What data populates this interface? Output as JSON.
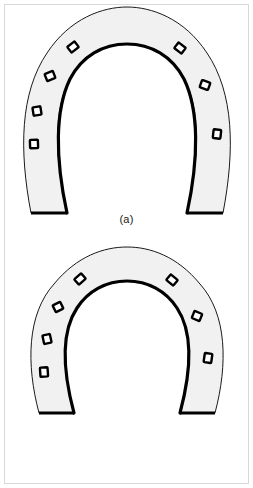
{
  "page": {
    "background_color": "#ffffff",
    "border_color": "#d8d8d8",
    "width": 253,
    "height": 488
  },
  "figures": [
    {
      "id": "figure-a",
      "caption": "(a)",
      "object": "horseshoe",
      "description": "horseshoe outline, plan view, fullered shoe with nail holes",
      "fill_color": "#f1f1f1",
      "outer_stroke_color": "#1a1a1a",
      "inner_stroke_color": "#000000",
      "outer_stroke_width": 1,
      "inner_stroke_width": 3,
      "nail_holes": {
        "total": 7,
        "left_branch": 4,
        "right_branch": 3,
        "hole_fill": "#ffffff",
        "hole_stroke": "#000000"
      }
    },
    {
      "id": "figure-b",
      "caption": "(b)",
      "object": "horseshoe",
      "description": "horseshoe outline, plan view, narrower web with nail holes",
      "fill_color": "#f1f1f1",
      "outer_stroke_color": "#1a1a1a",
      "inner_stroke_color": "#000000",
      "outer_stroke_width": 1,
      "inner_stroke_width": 3,
      "nail_holes": {
        "total": 7,
        "left_branch": 4,
        "right_branch": 3,
        "hole_fill": "#ffffff",
        "hole_stroke": "#000000"
      }
    }
  ]
}
